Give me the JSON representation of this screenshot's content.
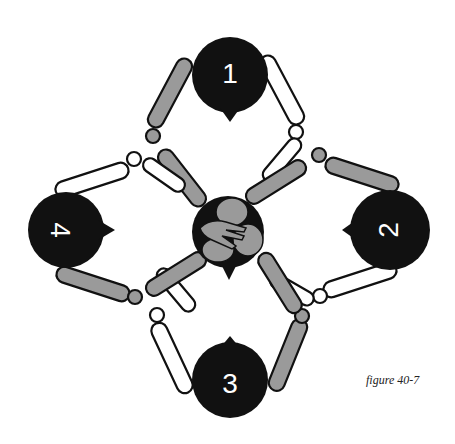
{
  "figure": {
    "caption": "figure 40-7",
    "colors": {
      "head": "#111111",
      "limb_shaded": "#9a9a9a",
      "limb_open": "#ffffff",
      "outline": "#111111"
    }
  },
  "diagram": {
    "figures": [
      {
        "id": 1,
        "label": "1",
        "position": "top"
      },
      {
        "id": 2,
        "label": "2",
        "position": "right"
      },
      {
        "id": 3,
        "label": "3",
        "position": "bottom"
      },
      {
        "id": 4,
        "label": "4",
        "position": "left"
      }
    ],
    "center": {
      "label": "joined-hands"
    }
  }
}
